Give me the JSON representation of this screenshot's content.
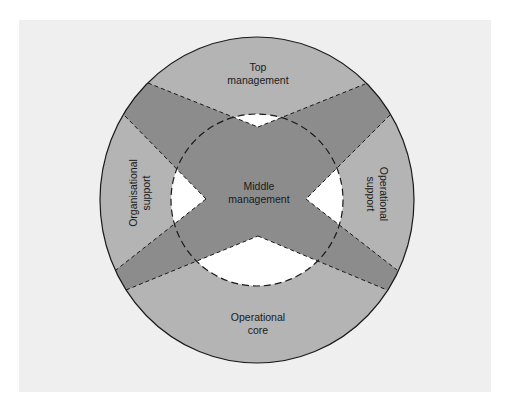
{
  "diagram": {
    "type": "organisational-structure-circle",
    "colors": {
      "background_panel": "#efefef",
      "outer_ring": "#b4b4b4",
      "middle_band": "#8c8c8c",
      "inner_gap": "#ffffff",
      "outline": "#1a1a1a"
    },
    "regions": {
      "top": {
        "line1": "Top",
        "line2": "management"
      },
      "center": {
        "line1": "Middle",
        "line2": "management"
      },
      "left": {
        "line1": "Organisational",
        "line2": "support"
      },
      "right": {
        "line1": "Operational",
        "line2": "support"
      },
      "bottom": {
        "line1": "Operational",
        "line2": "core"
      }
    }
  }
}
